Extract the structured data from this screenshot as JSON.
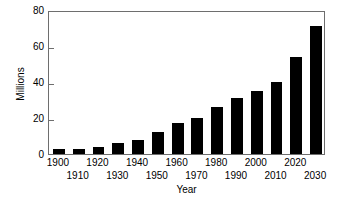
{
  "chart_data": {
    "type": "bar",
    "title": "",
    "subtitle": "",
    "xlabel": "Year",
    "ylabel": "Millions",
    "categories": [
      "1900",
      "1910",
      "1920",
      "1930",
      "1940",
      "1950",
      "1960",
      "1970",
      "1980",
      "1990",
      "2000",
      "2010",
      "2020",
      "2030"
    ],
    "values": [
      3,
      3,
      4,
      6,
      8,
      12,
      17,
      20,
      26,
      31,
      35,
      40,
      54,
      71
    ],
    "series": [
      {
        "name": "Millions",
        "values": [
          3,
          3,
          4,
          6,
          8,
          12,
          17,
          20,
          26,
          31,
          35,
          40,
          54,
          71
        ]
      }
    ],
    "ylim": [
      0,
      80
    ],
    "yticks": [
      0,
      20,
      40,
      60,
      80
    ],
    "ytick_labels": [
      "0",
      "20",
      "40",
      "60",
      "80"
    ],
    "xtick_labels": [
      "1900",
      "1910",
      "1920",
      "1930",
      "1940",
      "1950",
      "1960",
      "1970",
      "1980",
      "1990",
      "2000",
      "2010",
      "2020",
      "2030"
    ],
    "xtick_rows": [
      0,
      1,
      0,
      1,
      0,
      1,
      0,
      1,
      0,
      1,
      0,
      1,
      0,
      1
    ],
    "grid": false,
    "legend": false,
    "legend_position": "none",
    "bar_color": "#000000",
    "axis_color": "#6e6e6e",
    "background_color": "#ffffff",
    "annotations": []
  }
}
